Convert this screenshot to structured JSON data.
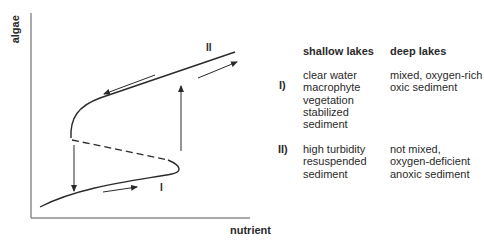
{
  "axes": {
    "y_label": "algae",
    "x_label": "nutrient"
  },
  "curve_labels": {
    "lower_state": "I",
    "upper_state": "II"
  },
  "table": {
    "headers": [
      "shallow lakes",
      "deep lakes"
    ],
    "rows": [
      {
        "label": "I)",
        "shallow": [
          "clear water",
          "macrophyte",
          "vegetation",
          "stabilized",
          "sediment"
        ],
        "deep": [
          "mixed, oxygen-rich",
          "oxic sediment"
        ]
      },
      {
        "label": "II)",
        "shallow": [
          "high turbidity",
          "resuspended",
          "sediment"
        ],
        "deep": [
          "not mixed,",
          "oxygen-deficient",
          "anoxic sediment"
        ]
      }
    ]
  },
  "colors": {
    "ink": "#2a2a2a",
    "background": "#ffffff"
  }
}
